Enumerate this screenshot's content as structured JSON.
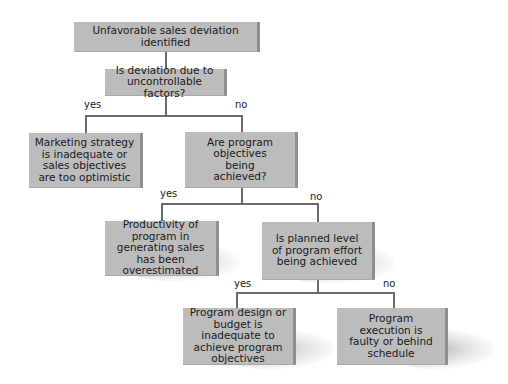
{
  "diagram": {
    "type": "decision-flowchart",
    "colors": {
      "box_fill": "#bcbcbc",
      "box_edge": "#8e8e8e",
      "connector": "#6b6b6b",
      "text": "#1a1a1a"
    },
    "nodes": {
      "start": "Unfavorable sales deviation identified",
      "q1": "Is deviation due to uncontrollable factors?",
      "r1": "Marketing strategy is inadequate or sales objectives are too optimistic",
      "q2": "Are program objectives being achieved?",
      "r2": "Productivity of program in generating sales has been overestimated",
      "q3": "Is planned level of program effort being achieved",
      "r3": "Program design or budget is inadequate to achieve program objectives",
      "r4": "Program execution is faulty or behind schedule"
    },
    "edges": {
      "q1_yes": "yes",
      "q1_no": "no",
      "q2_yes": "yes",
      "q2_no": "no",
      "q3_yes": "yes",
      "q3_no": "no"
    }
  }
}
